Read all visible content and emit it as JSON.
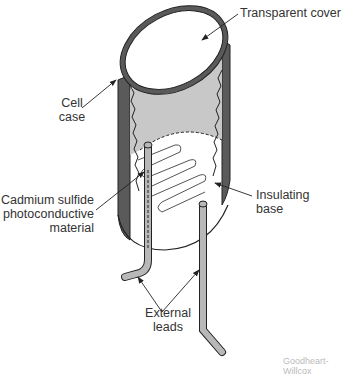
{
  "diagram": {
    "labels": {
      "transparent_cover": "Transparent cover",
      "cell_case_1": "Cell",
      "cell_case_2": "case",
      "cds_1": "Cadmium sulfide",
      "cds_2": "photoconductive",
      "cds_3": "material",
      "insulating_1": "Insulating",
      "insulating_2": "base",
      "leads_1": "External",
      "leads_2": "leads"
    },
    "watermark": "Goodheart-Willcox",
    "colors": {
      "case": "#5a5a5a",
      "interior": "#c8c8c8",
      "lead": "#b8b8b8",
      "outline": "#222222"
    }
  }
}
